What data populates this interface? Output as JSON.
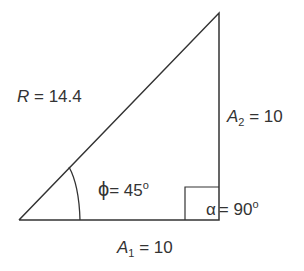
{
  "diagram": {
    "type": "right-triangle",
    "hypotenuse": {
      "symbol": "R",
      "eq": " = 14.4"
    },
    "vertical_side": {
      "symbol": "A",
      "sub": "2",
      "eq": " = 10"
    },
    "horizontal_side": {
      "symbol": "A",
      "sub": "1",
      "eq": " = 10"
    },
    "angle_phi": {
      "symbol": "ϕ",
      "eq": "= 45",
      "deg": "o"
    },
    "angle_alpha": {
      "symbol": "α",
      "eq": "= 90",
      "deg": "o"
    },
    "line_color": "#333333"
  }
}
